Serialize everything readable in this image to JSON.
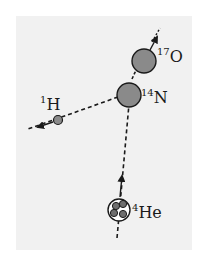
{
  "diagram": {
    "title": "",
    "type": "nuclear-reaction",
    "colors": {
      "background": "#ffffff",
      "panel": "#f1f1f1",
      "nucleus_fill": "#8a8a8a",
      "stroke": "#1a1a1a"
    },
    "particles": [
      {
        "id": "oxygen",
        "mass_number": "17",
        "symbol": "O",
        "role": "product"
      },
      {
        "id": "nitrogen",
        "mass_number": "14",
        "symbol": "N",
        "role": "target"
      },
      {
        "id": "hydrogen",
        "mass_number": "1",
        "symbol": "H",
        "role": "product"
      },
      {
        "id": "helium",
        "mass_number": "4",
        "symbol": "He",
        "role": "projectile"
      }
    ]
  },
  "labels": {
    "oxygen_mass": "17",
    "oxygen_symbol": "O",
    "nitrogen_mass": "14",
    "nitrogen_symbol": "N",
    "hydrogen_mass": "1",
    "hydrogen_symbol": "H",
    "helium_mass": "4",
    "helium_symbol": "He"
  }
}
